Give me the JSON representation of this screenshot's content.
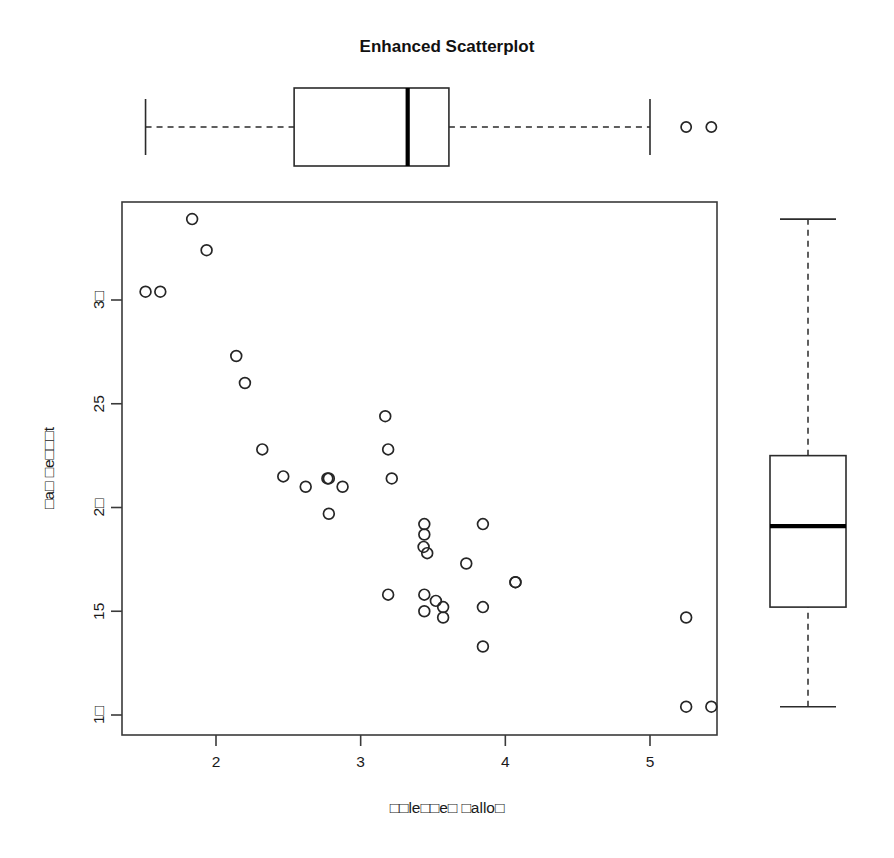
{
  "chart_data": {
    "type": "scatter",
    "title": "Enhanced Scatterplot",
    "xlabel": "□□le□□e□ □allo□",
    "ylabel": "□a□ □e□□□t",
    "xlim": [
      1.38,
      5.58
    ],
    "ylim": [
      9.6,
      34.6
    ],
    "xticks": [
      2,
      3,
      4,
      5
    ],
    "xtick_labels": [
      "2",
      "3",
      "4",
      "5"
    ],
    "yticks": [
      10,
      15,
      20,
      25,
      30
    ],
    "ytick_labels": [
      "1□",
      "15",
      "2□",
      "25",
      "3□"
    ],
    "grid": false,
    "legend": null,
    "marker": "open-circle",
    "x": [
      1.513,
      1.615,
      1.835,
      1.935,
      2.14,
      2.2,
      2.32,
      2.465,
      2.62,
      2.77,
      2.78,
      2.875,
      2.78,
      3.17,
      3.19,
      3.215,
      3.44,
      3.44,
      3.435,
      3.46,
      3.44,
      3.52,
      3.57,
      3.44,
      3.19,
      3.845,
      3.73,
      3.845,
      3.57,
      4.07,
      3.845,
      4.07,
      5.25,
      5.25,
      5.424
    ],
    "y": [
      30.4,
      30.4,
      33.9,
      32.4,
      27.3,
      26.0,
      22.8,
      21.5,
      21.0,
      21.4,
      21.4,
      21.0,
      19.7,
      24.4,
      22.8,
      21.4,
      19.2,
      18.7,
      18.1,
      17.8,
      15.8,
      15.5,
      15.2,
      15.0,
      15.8,
      19.2,
      17.3,
      15.2,
      14.7,
      16.4,
      13.3,
      16.4,
      14.7,
      10.4,
      10.4
    ],
    "x_box": {
      "orientation": "horizontal",
      "min_whisker": 1.513,
      "q1": 2.54,
      "median": 3.325,
      "q3": 3.61,
      "max_whisker": 5.0,
      "outliers": [
        5.25,
        5.424
      ]
    },
    "y_box": {
      "orientation": "vertical",
      "min_whisker": 10.4,
      "q1": 15.2,
      "median": 19.1,
      "q3": 22.5,
      "max_whisker": 33.9,
      "outliers": []
    },
    "colors": {
      "marker_stroke": "#262626",
      "frame": "#3a3a3a",
      "box_stroke": "#2b2b2b",
      "median": "#000000",
      "background": "#ffffff"
    }
  }
}
